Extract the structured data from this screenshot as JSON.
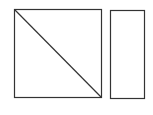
{
  "diagram": {
    "background": "#ffffff",
    "stroke_color": "#333333",
    "shapes": [
      {
        "type": "rect",
        "name": "square",
        "x": 14.5,
        "y": 9.5,
        "width": 87,
        "height": 88
      },
      {
        "type": "line",
        "name": "diagonal",
        "x1": 14.5,
        "y1": 9.5,
        "x2": 101.5,
        "y2": 97.5
      },
      {
        "type": "rect",
        "name": "tall-rectangle",
        "x": 110.5,
        "y": 10.5,
        "width": 34,
        "height": 88
      }
    ]
  }
}
